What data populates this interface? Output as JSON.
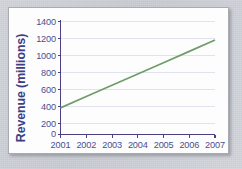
{
  "figure": {
    "background_color": "#c9ccd3",
    "card_color": "#fdfdfd",
    "card_border_color": "#a8abb2"
  },
  "chart_data": {
    "type": "line",
    "title": "",
    "subtitle": "",
    "xlabel": "",
    "ylabel": "Revenue (millions)",
    "x": [
      2001,
      2002,
      2003,
      2004,
      2005,
      2006,
      2007
    ],
    "categories": [
      "2001",
      "2002",
      "2003",
      "2004",
      "2005",
      "2006",
      "2007"
    ],
    "series": [
      {
        "name": "Revenue",
        "color": "#6f9d6a",
        "values": [
          330,
          470,
          610,
          750,
          890,
          1030,
          1170
        ]
      }
    ],
    "xlim": [
      2001,
      2007
    ],
    "ylim": [
      0,
      1400
    ],
    "ytick_labels": [
      "0",
      "200",
      "400",
      "600",
      "800",
      "1000",
      "1200",
      "1400"
    ],
    "ytick_values": [
      0,
      200,
      400,
      600,
      800,
      1000,
      1200,
      1400
    ],
    "xtick_labels": [
      "2001",
      "2002",
      "2003",
      "2004",
      "2005",
      "2006",
      "2007"
    ],
    "grid": "horizontal",
    "grid_color": "#e2e2ee",
    "legend": "none",
    "axis_color": "#4b3f86",
    "tick_label_color": "#4a4e90",
    "axis_title_color": "#3b3f86"
  }
}
